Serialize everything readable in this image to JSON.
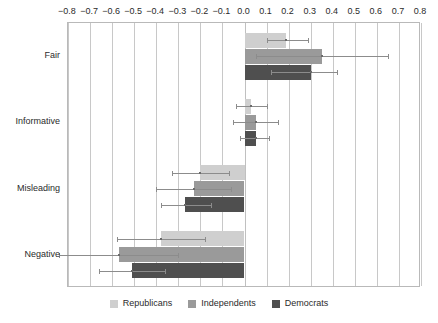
{
  "chart_data": {
    "type": "bar",
    "orientation": "horizontal",
    "title": "",
    "xlabel": "",
    "ylabel": "",
    "categories": [
      "Fair",
      "Informative",
      "Misleading",
      "Negative"
    ],
    "xlim": [
      -0.8,
      0.8
    ],
    "xticks": [
      -0.8,
      -0.7,
      -0.6,
      -0.5,
      -0.4,
      -0.3,
      -0.2,
      -0.1,
      0.0,
      0.1,
      0.2,
      0.3,
      0.4,
      0.5,
      0.6,
      0.7,
      0.8
    ],
    "xticklabels": [
      "−0.8",
      "−0.7",
      "−0.6",
      "−0.5",
      "−0.4",
      "−0.3",
      "−0.2",
      "−0.1",
      "0.0",
      "0.1",
      "0.2",
      "0.3",
      "0.4",
      "0.5",
      "0.6",
      "0.7",
      "0.8"
    ],
    "grid": true,
    "grid_axis": "x",
    "legend_position": "bottom",
    "error_bars": true,
    "series": [
      {
        "name": "Republicans",
        "color": "#cfcfcf",
        "values": [
          0.19,
          0.03,
          -0.2,
          -0.38
        ],
        "err_low": [
          0.1,
          -0.04,
          -0.33,
          -0.58
        ],
        "err_high": [
          0.29,
          0.1,
          -0.07,
          -0.18
        ]
      },
      {
        "name": "Independents",
        "color": "#9a9a9a",
        "values": [
          0.35,
          0.05,
          -0.23,
          -0.57
        ],
        "err_low": [
          0.05,
          -0.05,
          -0.4,
          -0.84
        ],
        "err_high": [
          0.65,
          0.15,
          -0.06,
          -0.3
        ]
      },
      {
        "name": "Democrats",
        "color": "#4f4f4f",
        "values": [
          0.3,
          0.05,
          -0.27,
          -0.51
        ],
        "err_low": [
          0.12,
          -0.02,
          -0.38,
          -0.66
        ],
        "err_high": [
          0.42,
          0.11,
          -0.15,
          -0.36
        ]
      }
    ]
  },
  "legend": {
    "items": [
      {
        "label": "Republicans",
        "key": "rep"
      },
      {
        "label": "Independents",
        "key": "ind"
      },
      {
        "label": "Democrats",
        "key": "dem"
      }
    ]
  }
}
